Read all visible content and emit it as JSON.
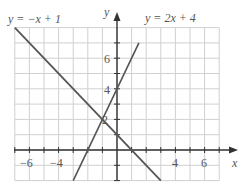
{
  "chart_data": {
    "type": "line",
    "title": "",
    "xlabel": "x",
    "ylabel": "y",
    "xlim": [
      -7,
      7.5
    ],
    "ylim": [
      -2,
      8
    ],
    "grid": true,
    "x_ticks": [
      -6,
      -4,
      4,
      6
    ],
    "y_ticks": [
      2,
      4,
      6
    ],
    "series": [
      {
        "name": "y = −x + 1",
        "equation": "y = -x + 1",
        "slope": -1,
        "intercept": 1,
        "x": [
          -7,
          3
        ],
        "y": [
          8,
          -2
        ]
      },
      {
        "name": "y = 2x + 4",
        "equation": "y = 2x + 4",
        "slope": 2,
        "intercept": 4,
        "x": [
          -3,
          1.5
        ],
        "y": [
          -2,
          7
        ]
      }
    ],
    "annotations": [
      {
        "text": "y = −x + 1",
        "near": "top-left"
      },
      {
        "text": "y = 2x + 4",
        "near": "top-right"
      }
    ],
    "intersection": {
      "x": -1,
      "y": 2
    }
  },
  "labels": {
    "eq1": "y = −x + 1",
    "eq2": "y = 2x + 4",
    "x_axis": "x",
    "y_axis": "y",
    "tick_neg6": "−6",
    "tick_neg4": "−4",
    "tick_4": "4",
    "tick_6": "6",
    "ytick_2": "2",
    "ytick_4": "4",
    "ytick_6": "6"
  },
  "colors": {
    "grid": "#d0d0d0",
    "axis": "#333333",
    "line": "#555555",
    "text": "#555555"
  }
}
